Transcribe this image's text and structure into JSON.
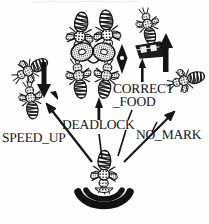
{
  "figure": {
    "domain": "scanned-diagram",
    "background_color": "#fefefe",
    "ink_color": "#141414"
  },
  "labels": {
    "speed_up": "SPEED_UP",
    "deadlock": "DEADLOCK",
    "correct": "CORRECT",
    "food": "_FOOD",
    "no_mark": "NO_MARK"
  },
  "nodes": [
    {
      "id": "dancer",
      "name": "waggle-dancing-bee",
      "x": 104,
      "y": 170
    },
    {
      "id": "speed-up-bees",
      "name": "speed-up-bee-pair",
      "x": 30,
      "y": 85
    },
    {
      "id": "deadlock-bees",
      "name": "deadlock-bee-cluster",
      "x": 92,
      "y": 55
    },
    {
      "id": "correct-food",
      "name": "bee-on-food-source",
      "x": 152,
      "y": 35
    },
    {
      "id": "no-mark-bee",
      "name": "unmarked-bee",
      "x": 185,
      "y": 85
    }
  ],
  "arrows": [
    {
      "name": "arrow-to-speed-up",
      "label_ref": "speed_up",
      "direction": "up-left"
    },
    {
      "name": "arrow-to-deadlock",
      "label_ref": "deadlock",
      "direction": "up"
    },
    {
      "name": "arrow-to-correct-food",
      "label_ref": "food",
      "direction": "up"
    },
    {
      "name": "arrow-to-no-mark",
      "label_ref": "no_mark",
      "direction": "up-right"
    },
    {
      "name": "arrow-speed-up-marker",
      "label_ref": "speed_up",
      "direction": "down"
    },
    {
      "name": "arrow-deadlock-marker",
      "label_ref": "deadlock",
      "direction": "both"
    },
    {
      "name": "arrow-food-marker",
      "label_ref": "food",
      "direction": "up"
    }
  ]
}
